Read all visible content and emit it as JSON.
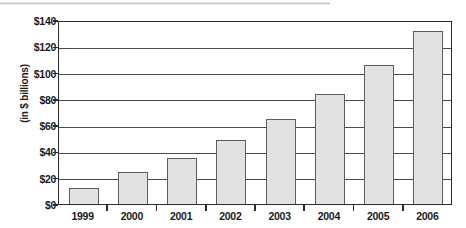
{
  "chart_data": {
    "type": "bar",
    "title": "",
    "subtitle": "",
    "xlabel": "",
    "ylabel": "(in $ billions)",
    "categories": [
      "1999",
      "2000",
      "2001",
      "2002",
      "2003",
      "2004",
      "2005",
      "2006"
    ],
    "values": [
      12,
      24,
      35,
      48.5,
      65,
      84,
      105.5,
      131.5
    ],
    "ylim": [
      0,
      140
    ],
    "ytick_values": [
      0,
      20,
      40,
      60,
      80,
      100,
      120,
      140
    ],
    "ytick_labels": [
      "$0",
      "$20",
      "$40",
      "$60",
      "$80",
      "$100",
      "$120",
      "$140"
    ],
    "grid": true,
    "legend": false,
    "legend_position": "none",
    "bar_fill_color": "#e2e2e2",
    "bar_border_color": "#5d5d5d",
    "axis_color": "#2b2b2b",
    "gridline_color": "#4a4a4a",
    "background_color": "#ffffff",
    "text_color": "#1a1a1a"
  }
}
